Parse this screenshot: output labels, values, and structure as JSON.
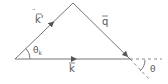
{
  "diagram": {
    "type": "vector-triangle",
    "vectors": [
      {
        "name": "k_prime",
        "label": "k'",
        "from": "left-vertex",
        "to": "apex"
      },
      {
        "name": "q",
        "label": "q",
        "from": "apex",
        "to": "right-vertex"
      },
      {
        "name": "k",
        "label": "k",
        "from": "left-vertex",
        "to": "right-vertex"
      }
    ],
    "angles": [
      {
        "name": "theta_k",
        "label": "θ",
        "subscript": "k"
      },
      {
        "name": "theta",
        "label": "θ"
      }
    ],
    "colors": {
      "line": "#777777",
      "text": "#555555",
      "background": "#ffffff"
    }
  }
}
